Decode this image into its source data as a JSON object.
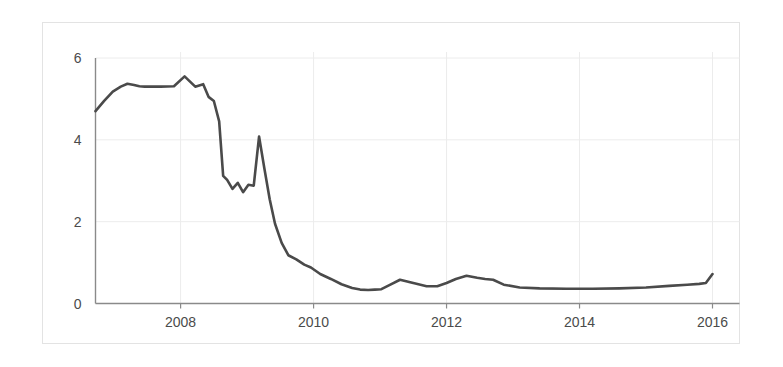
{
  "chart_data": {
    "type": "line",
    "title": "",
    "subtitle": "",
    "xlabel": "",
    "ylabel": "",
    "xlim": [
      2006.72,
      2016.0
    ],
    "ylim": [
      0,
      6
    ],
    "grid": true,
    "legend": null,
    "x_ticks": [
      2008,
      2010,
      2012,
      2014,
      2016
    ],
    "x_tick_labels": [
      "2008",
      "2010",
      "2012",
      "2014",
      "2016"
    ],
    "y_ticks": [
      0,
      2,
      4,
      6
    ],
    "y_tick_labels": [
      "0",
      "2",
      "4",
      "6"
    ],
    "line_color": "#4a4a4a",
    "grid_color": "#ececec",
    "axis_color": "#8a8a8a",
    "frame_color": "#e3e3e3",
    "background_color": "#ffffff",
    "series": [
      {
        "name": "series-1",
        "x": [
          2006.72,
          2006.85,
          2006.98,
          2007.1,
          2007.2,
          2007.3,
          2007.38,
          2007.46,
          2007.54,
          2007.7,
          2007.9,
          2008.06,
          2008.22,
          2008.34,
          2008.42,
          2008.5,
          2008.58,
          2008.64,
          2008.7,
          2008.78,
          2008.86,
          2008.94,
          2009.02,
          2009.1,
          2009.18,
          2009.26,
          2009.34,
          2009.42,
          2009.52,
          2009.62,
          2009.74,
          2009.86,
          2009.96,
          2010.1,
          2010.26,
          2010.42,
          2010.58,
          2010.7,
          2010.82,
          2010.92,
          2011.02,
          2011.14,
          2011.3,
          2011.5,
          2011.7,
          2011.86,
          2012.0,
          2012.14,
          2012.3,
          2012.46,
          2012.58,
          2012.7,
          2012.86,
          2013.1,
          2013.4,
          2013.8,
          2014.2,
          2014.6,
          2015.0,
          2015.35,
          2015.62,
          2015.8,
          2015.9,
          2016.0
        ],
        "y": [
          4.7,
          4.95,
          5.18,
          5.3,
          5.37,
          5.34,
          5.31,
          5.3,
          5.3,
          5.3,
          5.31,
          5.55,
          5.3,
          5.36,
          5.05,
          4.95,
          4.45,
          3.12,
          3.02,
          2.8,
          2.95,
          2.72,
          2.9,
          2.88,
          4.08,
          3.3,
          2.55,
          1.95,
          1.48,
          1.18,
          1.08,
          0.95,
          0.88,
          0.72,
          0.6,
          0.47,
          0.38,
          0.34,
          0.33,
          0.34,
          0.35,
          0.45,
          0.58,
          0.5,
          0.42,
          0.42,
          0.5,
          0.6,
          0.68,
          0.63,
          0.6,
          0.58,
          0.46,
          0.39,
          0.37,
          0.36,
          0.36,
          0.37,
          0.39,
          0.43,
          0.46,
          0.48,
          0.5,
          0.72
        ]
      }
    ]
  }
}
